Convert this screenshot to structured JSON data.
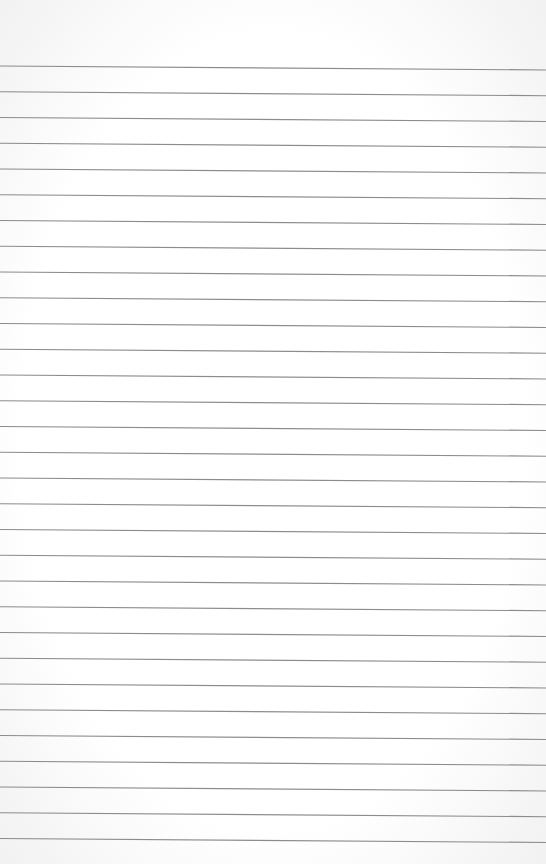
{
  "page": {
    "type": "lined-paper",
    "background_color": "#ffffff",
    "line_color": "#8c8c8c",
    "line_count": 31,
    "first_line_y_left": 66,
    "first_line_y_right": 70,
    "line_spacing": 25.75,
    "line_width": 1.2
  }
}
